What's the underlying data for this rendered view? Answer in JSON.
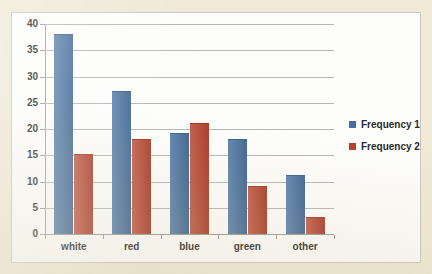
{
  "chart_data": {
    "type": "bar",
    "title": "",
    "subtitle": "",
    "xlabel": "",
    "ylabel": "",
    "categories": [
      "white",
      "red",
      "blue",
      "green",
      "other"
    ],
    "series": [
      {
        "name": "Frequency 1",
        "color": "#446fa0",
        "values": [
          38,
          27,
          19,
          18,
          11
        ]
      },
      {
        "name": "Frequency 2",
        "color": "#b8402a",
        "values": [
          15,
          18,
          21,
          9,
          3
        ]
      }
    ],
    "ylim": [
      0,
      40
    ],
    "ytick_step": 5,
    "yticks": [
      0,
      5,
      10,
      15,
      20,
      25,
      30,
      35,
      40
    ],
    "ytick_labels": [
      "0",
      "5",
      "10",
      "15",
      "20",
      "25",
      "30",
      "35",
      "40"
    ],
    "grid": true,
    "grid_axis": "y",
    "legend_position": "right",
    "bar_grouping": "clustered",
    "annotations": []
  },
  "legend": {
    "entries": [
      {
        "label": "Frequency 1",
        "color": "#446fa0"
      },
      {
        "label": "Frequency 2",
        "color": "#b8402a"
      }
    ]
  },
  "colors": {
    "page_background": "#efe9d5",
    "plot_background": "#fdfdfb",
    "plot_border": "#c9c7c0",
    "gridline": "#b7b7b2",
    "axis_line": "#9a9a95",
    "tick_label": "#2a2a28",
    "series_1": "#446fa0",
    "series_2": "#b8402a"
  }
}
